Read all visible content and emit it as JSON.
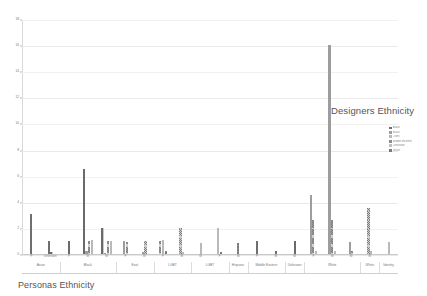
{
  "chart_data": {
    "type": "bar",
    "title": "Designers Ethnicity",
    "subtitle": "Personas Ethnicity",
    "xlabel": "",
    "ylabel": "",
    "ylim": [
      0,
      18
    ],
    "grid": true,
    "legend_position": "right",
    "y_ticks": [
      0,
      2,
      4,
      6,
      8,
      10,
      12,
      14,
      16,
      18
    ],
    "y_tick_labels": [
      "0",
      "2",
      "4",
      "6",
      "8",
      "10",
      "12",
      "14",
      "16",
      "18"
    ],
    "groups": [
      {
        "label": "Asian",
        "ticks": [
          {
            "label": "F",
            "values": [
              3.1
            ]
          },
          {
            "label": "Unknown",
            "values": [
              1.0,
              0.15
            ]
          }
        ]
      },
      {
        "label": "Black",
        "ticks": [
          {
            "label": "F",
            "values": [
              1.0
            ]
          },
          {
            "label": "M",
            "values": [
              6.5,
              0.2,
              1.0,
              1.05
            ]
          },
          {
            "label": "M",
            "values": [
              2.0,
              0.1,
              1.0,
              1.0
            ]
          }
        ]
      },
      {
        "label": "East",
        "ticks": [
          {
            "label": "F",
            "values": [
              1.0,
              0.9
            ]
          },
          {
            "label": "M",
            "values": [
              0.15,
              1.0
            ]
          }
        ]
      },
      {
        "label": "LGBT",
        "ticks": [
          {
            "label": "F",
            "values": [
              1.0,
              1.05,
              0.2
            ]
          },
          {
            "label": "M",
            "values": [
              2.0,
              0.15
            ]
          }
        ]
      },
      {
        "label": "LGBT",
        "ticks": [
          {
            "label": "M",
            "values": [
              0.85
            ]
          },
          {
            "label": "F",
            "values": [
              2.0,
              0.15
            ]
          }
        ]
      },
      {
        "label": "Hispanic",
        "ticks": [
          {
            "label": "M",
            "values": [
              0.85
            ]
          }
        ]
      },
      {
        "label": "Middle Eastern",
        "ticks": [
          {
            "label": "F",
            "values": [
              1.0
            ]
          },
          {
            "label": "M",
            "values": [
              0.2
            ]
          }
        ]
      },
      {
        "label": "Unknown",
        "ticks": [
          {
            "label": "M",
            "values": [
              1.0
            ]
          }
        ]
      },
      {
        "label": "White",
        "ticks": [
          {
            "label": "F",
            "values": [
              4.5,
              2.6,
              0.2
            ]
          },
          {
            "label": "M",
            "values": [
              16.0,
              2.6,
              0.25
            ]
          },
          {
            "label": "M",
            "values": [
              0.9,
              0.2
            ]
          }
        ]
      },
      {
        "label": "White",
        "ticks": [
          {
            "label": "M",
            "values": [
              3.5,
              0.25
            ]
          }
        ]
      },
      {
        "label": "Identity",
        "ticks": [
          {
            "label": "",
            "values": [
              0.9
            ]
          }
        ]
      }
    ],
    "legend": [
      {
        "label": "Asian",
        "color": "#6f6f6f"
      },
      {
        "label": "Black",
        "color": "#9d9d9d"
      },
      {
        "label": "LGBT",
        "color": "#b9b9b9"
      },
      {
        "label": "Middle Eastern",
        "color": "#8a8a8a"
      },
      {
        "label": "Unknown",
        "color": "#c0c0c0"
      },
      {
        "label": "White",
        "color": "#7a7a7a"
      }
    ]
  },
  "colors": {
    "gridline": "#e9e9e9",
    "axis": "#c9c9c9",
    "text": "#777777",
    "bar_default": "#8a8a8a"
  }
}
